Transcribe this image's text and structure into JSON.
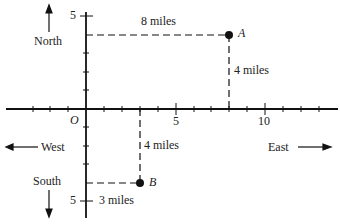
{
  "labels": {
    "north": "North",
    "south": "South",
    "east": "East",
    "west": "West",
    "origin": "O",
    "x_tick_5": "5",
    "x_tick_10": "10",
    "y_tick_5_top": "5",
    "y_tick_5_bottom": "5"
  },
  "points": [
    {
      "name": "A",
      "x": 8,
      "y": 4
    },
    {
      "name": "B",
      "x": 3,
      "y": -4
    }
  ],
  "distances": {
    "a_horizontal": "8 miles",
    "a_vertical": "4 miles",
    "b_vertical": "4 miles",
    "b_horizontal": "3 miles"
  }
}
